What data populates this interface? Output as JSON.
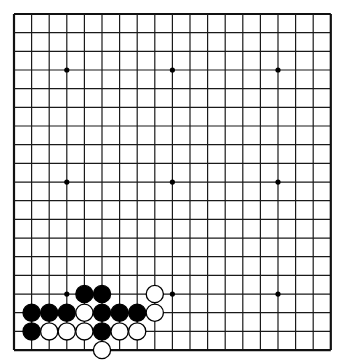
{
  "board": {
    "size": 19,
    "origin_x": 14,
    "origin_y": 14,
    "spacing_x": 17.6,
    "spacing_y": 18.67,
    "line_color": "#1a1a1a",
    "border_color": "#111111",
    "star_points": [
      [
        3,
        3
      ],
      [
        9,
        3
      ],
      [
        15,
        3
      ],
      [
        3,
        9
      ],
      [
        9,
        9
      ],
      [
        15,
        9
      ],
      [
        3,
        15
      ],
      [
        9,
        15
      ],
      [
        15,
        15
      ]
    ],
    "stone_radius": 8.6
  },
  "stones": {
    "black": [
      [
        4,
        15
      ],
      [
        5,
        15
      ],
      [
        1,
        16
      ],
      [
        2,
        16
      ],
      [
        3,
        16
      ],
      [
        5,
        16
      ],
      [
        6,
        16
      ],
      [
        7,
        16
      ],
      [
        1,
        17
      ],
      [
        5,
        17
      ]
    ],
    "white": [
      [
        8,
        15
      ],
      [
        4,
        16
      ],
      [
        8,
        16
      ],
      [
        2,
        17
      ],
      [
        3,
        17
      ],
      [
        4,
        17
      ],
      [
        6,
        17
      ],
      [
        7,
        17
      ],
      [
        5,
        18
      ]
    ]
  }
}
